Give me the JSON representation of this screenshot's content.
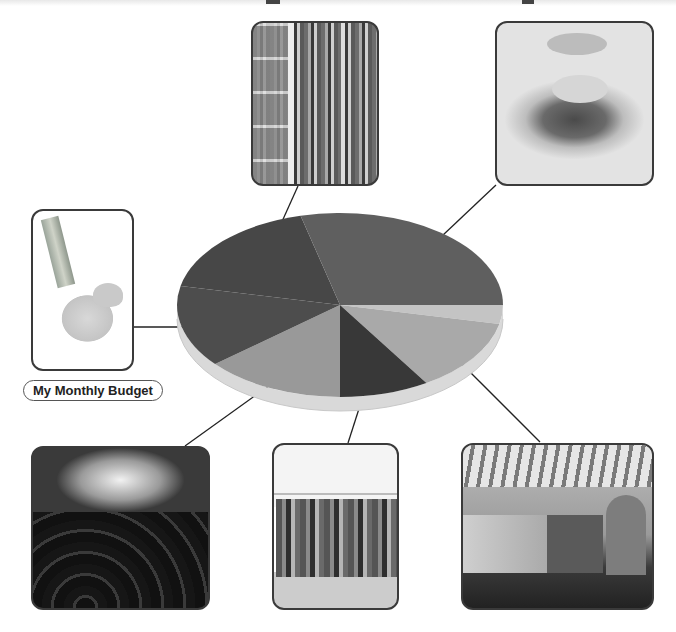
{
  "title": "My Monthly Budget",
  "chart_data": {
    "type": "pie",
    "style": "3d-grayscale",
    "title": "",
    "categories": [
      "Transportation",
      "Food",
      "Education / Books",
      "Savings",
      "Entertainment",
      "Clothing",
      "Other"
    ],
    "values": [
      16,
      33,
      14,
      16,
      15,
      3,
      3
    ],
    "slices_clockwise_from_3oclock": [
      {
        "name": "small-light",
        "color": "#c4c4c4",
        "start_deg": 0,
        "end_deg": 12
      },
      {
        "name": "transportation",
        "color": "#a9a9a9",
        "start_deg": 12,
        "end_deg": 58
      },
      {
        "name": "clothing",
        "color": "#383838",
        "start_deg": 58,
        "end_deg": 90
      },
      {
        "name": "entertainment",
        "color": "#999999",
        "start_deg": 90,
        "end_deg": 140
      },
      {
        "name": "savings",
        "color": "#4d4d4d",
        "start_deg": 140,
        "end_deg": 192
      },
      {
        "name": "education",
        "color": "#474747",
        "start_deg": 192,
        "end_deg": 256
      },
      {
        "name": "food",
        "color": "#5f5f5f",
        "start_deg": 256,
        "end_deg": 360
      }
    ],
    "legend": "none",
    "note": "Values estimated from slice angles; no numeric labels shown"
  },
  "images": [
    {
      "id": "piggy-bank",
      "caption": "My Monthly Budget"
    },
    {
      "id": "bookshelf"
    },
    {
      "id": "burger"
    },
    {
      "id": "concert"
    },
    {
      "id": "clothes-rack"
    },
    {
      "id": "subway-train"
    }
  ]
}
